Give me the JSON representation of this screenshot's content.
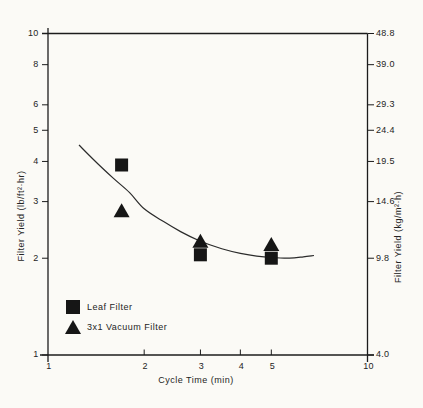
{
  "chart_data": {
    "type": "scatter",
    "title": "",
    "xlabel": "Cycle Time (min)",
    "ylabel_left": "Filter Yield (lb/ft²·hr)",
    "ylabel_right": "Filter Yield (kg/m²·h)",
    "xscale": "log",
    "yscale": "log",
    "xlim": [
      1,
      10
    ],
    "ylim": [
      1,
      10
    ],
    "grid": false,
    "legend_position": "lower-left",
    "xticks": [
      {
        "value": 1,
        "label": "1"
      },
      {
        "value": 2,
        "label": "2"
      },
      {
        "value": 3,
        "label": "3"
      },
      {
        "value": 4,
        "label": "4"
      },
      {
        "value": 5,
        "label": "5"
      },
      {
        "value": 10,
        "label": "10"
      }
    ],
    "yticks_left": [
      {
        "value": 1,
        "label": "1"
      },
      {
        "value": 2,
        "label": "2"
      },
      {
        "value": 3,
        "label": "3"
      },
      {
        "value": 4,
        "label": "4"
      },
      {
        "value": 5,
        "label": "5"
      },
      {
        "value": 6,
        "label": "6"
      },
      {
        "value": 8,
        "label": "8"
      },
      {
        "value": 10,
        "label": "10"
      }
    ],
    "yticks_right": [
      {
        "value": 1,
        "label": "4.0"
      },
      {
        "value": 2,
        "label": "9.8"
      },
      {
        "value": 3,
        "label": "14.6"
      },
      {
        "value": 4,
        "label": "19.5"
      },
      {
        "value": 5,
        "label": "24.4"
      },
      {
        "value": 6,
        "label": "29.3"
      },
      {
        "value": 8,
        "label": "39.0"
      },
      {
        "value": 10,
        "label": "48.8"
      }
    ],
    "series": [
      {
        "name": "Leaf Filter",
        "marker": "square",
        "points": [
          [
            1.7,
            3.9
          ],
          [
            3.0,
            2.05
          ],
          [
            5.0,
            2.0
          ]
        ]
      },
      {
        "name": "3x1 Vacuum Filter",
        "marker": "triangle",
        "points": [
          [
            1.7,
            2.8
          ],
          [
            3.0,
            2.25
          ],
          [
            5.0,
            2.2
          ]
        ]
      }
    ],
    "fit_curve": [
      [
        1.25,
        4.5
      ],
      [
        1.4,
        4.02
      ],
      [
        1.6,
        3.55
      ],
      [
        1.8,
        3.2
      ],
      [
        2.0,
        2.85
      ],
      [
        2.3,
        2.6
      ],
      [
        2.6,
        2.42
      ],
      [
        3.0,
        2.26
      ],
      [
        3.5,
        2.14
      ],
      [
        4.0,
        2.07
      ],
      [
        4.5,
        2.03
      ],
      [
        5.0,
        2.01
      ],
      [
        5.7,
        2.0
      ],
      [
        6.3,
        2.02
      ],
      [
        6.8,
        2.04
      ]
    ],
    "legend": [
      {
        "marker": "square",
        "label": "Leaf Filter"
      },
      {
        "marker": "triangle",
        "label": "3x1 Vacuum Filter"
      }
    ],
    "colors": {
      "ink": "#1c1c1c",
      "paper": "#fbfaf6",
      "marker": "#161616"
    }
  }
}
